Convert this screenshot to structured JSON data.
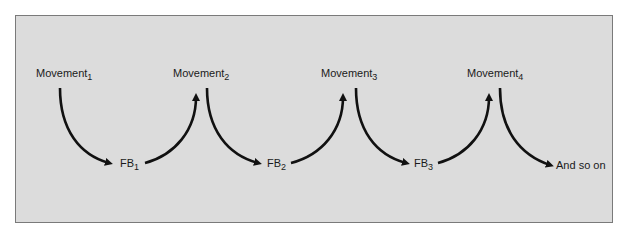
{
  "diagram": {
    "nodes": [
      {
        "id": "m1",
        "base": "Movement",
        "sub": "1"
      },
      {
        "id": "m2",
        "base": "Movement",
        "sub": "2"
      },
      {
        "id": "m3",
        "base": "Movement",
        "sub": "3"
      },
      {
        "id": "m4",
        "base": "Movement",
        "sub": "4"
      },
      {
        "id": "fb1",
        "base": "FB",
        "sub": "1"
      },
      {
        "id": "fb2",
        "base": "FB",
        "sub": "2"
      },
      {
        "id": "fb3",
        "base": "FB",
        "sub": "3"
      },
      {
        "id": "end",
        "base": "And so on",
        "sub": ""
      }
    ],
    "edges": [
      {
        "from": "m1",
        "to": "fb1"
      },
      {
        "from": "fb1",
        "to": "m2"
      },
      {
        "from": "m2",
        "to": "fb2"
      },
      {
        "from": "fb2",
        "to": "m3"
      },
      {
        "from": "m3",
        "to": "fb3"
      },
      {
        "from": "fb3",
        "to": "m4"
      },
      {
        "from": "m4",
        "to": "end"
      }
    ],
    "colors": {
      "background": "#dcdcdc",
      "border": "#7a7a7a",
      "arrow": "#111111"
    }
  }
}
